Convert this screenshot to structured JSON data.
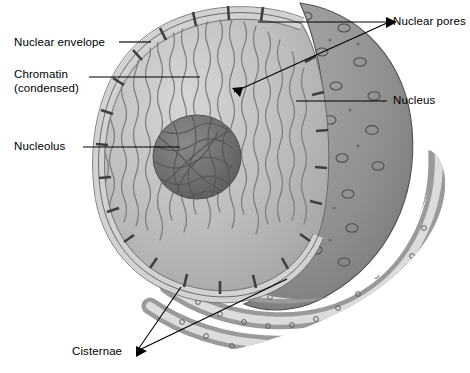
{
  "figure": {
    "width": 470,
    "height": 373,
    "background": "#ffffff",
    "line_color": "#000000",
    "label_font_size_px": 11.5
  },
  "labels": [
    {
      "id": "nuclear-envelope",
      "text": "Nuclear envelope",
      "x": 14,
      "y": 36,
      "align": "left",
      "leader": {
        "from": [
          119,
          42
        ],
        "to": [
          151,
          42
        ],
        "arrow": false
      }
    },
    {
      "id": "chromatin",
      "text": "Chromatin",
      "line2": "(condensed)",
      "x": 14,
      "y": 68,
      "align": "left",
      "leader": {
        "from": [
          89,
          77
        ],
        "to": [
          200,
          77
        ],
        "arrow": false
      }
    },
    {
      "id": "nucleolus",
      "text": "Nucleolus",
      "x": 14,
      "y": 140,
      "align": "left",
      "leader": {
        "from": [
          83,
          147
        ],
        "to": [
          180,
          147
        ],
        "arrow": false
      }
    },
    {
      "id": "nuclear-pores",
      "text": "Nuclear pores",
      "x": 393,
      "y": 17,
      "align": "left",
      "leader_fan": [
        {
          "from": [
            387,
            22
          ],
          "to": [
            255,
            22
          ],
          "arrow": true
        },
        {
          "from": [
            387,
            23
          ],
          "to": [
            232,
            93
          ],
          "arrow": true
        }
      ]
    },
    {
      "id": "nucleus",
      "text": "Nucleus",
      "x": 393,
      "y": 95,
      "align": "left",
      "leader": {
        "from": [
          387,
          101
        ],
        "to": [
          296,
          101
        ],
        "arrow": false
      }
    },
    {
      "id": "cisternae",
      "text": "Cisternae",
      "x": 72,
      "y": 347,
      "align": "left",
      "leader_fan": [
        {
          "from": [
            136,
            352
          ],
          "to": [
            180,
            286
          ],
          "arrow": true
        },
        {
          "from": [
            136,
            352
          ],
          "to": [
            288,
            278
          ],
          "arrow": true
        }
      ]
    }
  ],
  "structures": [
    {
      "id": "nuclear-envelope",
      "name": "Nuclear envelope",
      "description": "Double membrane bounding the nucleus, shown in cutaway as a pale banded rim",
      "color": "#cfcfcf"
    },
    {
      "id": "nuclear-pores",
      "name": "Nuclear pores",
      "description": "Ring-shaped openings piercing the envelope; seen as dark bars in cutaway and as rings on the outer surface",
      "color": "#4a4a4a"
    },
    {
      "id": "chromatin",
      "name": "Chromatin (condensed)",
      "description": "Wavy dark fibers filling the nuclear interior",
      "color": "#8c8c8c"
    },
    {
      "id": "nucleoplasm",
      "name": "Nucleoplasm",
      "description": "Light grey interior of the cut nucleus",
      "color": "#bdbdbd"
    },
    {
      "id": "nucleolus",
      "name": "Nucleolus",
      "description": "Dense dark grey sphere with tangled fibrillar texture",
      "color": "#6f6f6f"
    },
    {
      "id": "outer-surface",
      "name": "Outer nuclear surface",
      "description": "Mid-grey dome behind the cut, studded with pore rings",
      "color": "#8f8f8f"
    },
    {
      "id": "cisternae",
      "name": "Cisternae",
      "description": "Concentric flattened sacs of rough endoplasmic reticulum studded with ribosomes",
      "color": "#a8a8a8"
    }
  ],
  "colors": {
    "page_background": "#ffffff",
    "ink": "#000000",
    "nucleoplasm": "#bdbdbd",
    "chromatin_fiber": "#7d7d7d",
    "nucleolus": "#6f6f6f",
    "nucleolus_fiber": "#565656",
    "envelope_band": "#d2d2d2",
    "envelope_edge": "#5a5a5a",
    "pore_bar": "#4a4a4a",
    "outer_dome": "#8f8f8f",
    "er_lumen": "#dcdcdc",
    "er_membrane": "#9a9a9a",
    "ribosome": "#6a6a6a"
  }
}
